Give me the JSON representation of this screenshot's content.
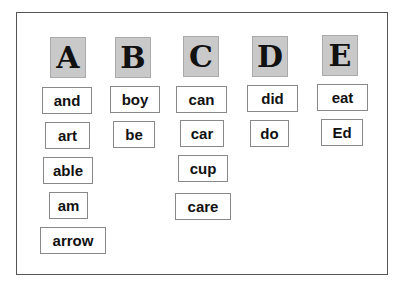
{
  "columns": [
    {
      "letter": "A",
      "words": [
        "and",
        "art",
        "able",
        "am",
        "arrow"
      ]
    },
    {
      "letter": "B",
      "words": [
        "boy",
        "be"
      ]
    },
    {
      "letter": "C",
      "words": [
        "can",
        "car",
        "cup",
        "care"
      ]
    },
    {
      "letter": "D",
      "words": [
        "did",
        "do"
      ]
    },
    {
      "letter": "E",
      "words": [
        "eat",
        "Ed"
      ]
    }
  ],
  "colors": {
    "letter_tile_bg": "#c9c9c9",
    "frame_border": "#555555",
    "word_border": "#888888",
    "text": "#111111"
  }
}
